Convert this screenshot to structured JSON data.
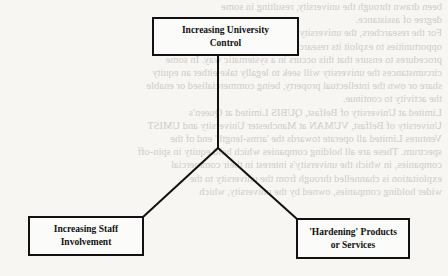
{
  "diagram": {
    "type": "hierarchy",
    "root": {
      "id": "university-control",
      "lines": [
        "Increasing University",
        "Control"
      ]
    },
    "children": [
      {
        "id": "staff-involvement",
        "lines": [
          "Increasing Staff",
          "Involvement"
        ]
      },
      {
        "id": "hardening-products",
        "lines": [
          "'Hardening' Products",
          "or Services"
        ]
      }
    ],
    "edges": [
      {
        "from": "university-control",
        "to": "staff-involvement"
      },
      {
        "from": "university-control",
        "to": "hardening-products"
      }
    ],
    "colors": {
      "stroke": "#111111",
      "page": "#f7f6f3",
      "bleed_text": "#cfcdc8"
    }
  },
  "background_bleed": {
    "note_visible": "faint mirrored bleed-through text from reverse side of scanned page",
    "lines": [
      "been drawn through the university, resulting in some",
      "degree of assistance.",
      "For the researchers, the university became active in seeking",
      "opportunities to exploit its research commercially and put in place",
      "procedures to ensure that this occurs in a systematic way. In some",
      "circumstances the university will seek to legally take either an equity",
      "share or own the intellectual property, being commercialised or enable",
      "the activity to continue.",
      "Limited at University of Belfast, QUBIS Limited at Queen's",
      "University of Belfast, VUMAN at Manchester University and UMIST",
      "Ventures Limited all operate towards the 'arms-length' end of the",
      "spectrum. These are all holding companies which hold equity in spin-off",
      "companies, in which the university's interest in their commercial",
      "exploitation is channelled through from the university to the",
      "wider holding companies, owned by the university, which"
    ]
  }
}
